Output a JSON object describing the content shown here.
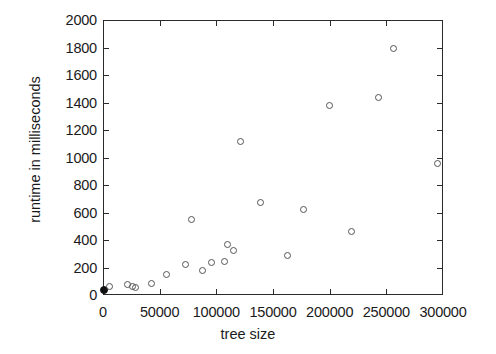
{
  "chart_data": {
    "type": "scatter",
    "title": "",
    "xlabel": "tree size",
    "ylabel": "runtime in milliseconds",
    "xlim": [
      0,
      300000
    ],
    "ylim": [
      0,
      2000
    ],
    "xticks": [
      0,
      50000,
      100000,
      150000,
      200000,
      250000,
      300000
    ],
    "yticks": [
      0,
      200,
      400,
      600,
      800,
      1000,
      1200,
      1400,
      1600,
      1800,
      2000
    ],
    "xtick_labels": [
      "0",
      "50000",
      "100000",
      "150000",
      "200000",
      "250000",
      "300000"
    ],
    "ytick_labels": [
      "0",
      "200",
      "400",
      "600",
      "800",
      "1000",
      "1200",
      "1400",
      "1600",
      "1800",
      "2000"
    ],
    "grid": false,
    "legend": null,
    "marker": "open-circle",
    "points": [
      {
        "x": 500,
        "y": 40,
        "style": "filled"
      },
      {
        "x": 6000,
        "y": 60,
        "style": "open"
      },
      {
        "x": 22000,
        "y": 75,
        "style": "open"
      },
      {
        "x": 26000,
        "y": 65,
        "style": "open"
      },
      {
        "x": 29000,
        "y": 58,
        "style": "open"
      },
      {
        "x": 43000,
        "y": 85,
        "style": "open"
      },
      {
        "x": 56000,
        "y": 150,
        "style": "open"
      },
      {
        "x": 73000,
        "y": 220,
        "style": "open"
      },
      {
        "x": 78000,
        "y": 550,
        "style": "open"
      },
      {
        "x": 88000,
        "y": 175,
        "style": "open"
      },
      {
        "x": 96000,
        "y": 240,
        "style": "open"
      },
      {
        "x": 107000,
        "y": 245,
        "style": "open"
      },
      {
        "x": 110000,
        "y": 365,
        "style": "open"
      },
      {
        "x": 115000,
        "y": 325,
        "style": "open"
      },
      {
        "x": 121000,
        "y": 1120,
        "style": "open"
      },
      {
        "x": 139000,
        "y": 675,
        "style": "open"
      },
      {
        "x": 163000,
        "y": 285,
        "style": "open"
      },
      {
        "x": 177000,
        "y": 625,
        "style": "open"
      },
      {
        "x": 200000,
        "y": 1380,
        "style": "open"
      },
      {
        "x": 219000,
        "y": 460,
        "style": "open"
      },
      {
        "x": 243000,
        "y": 1440,
        "style": "open"
      },
      {
        "x": 256000,
        "y": 1795,
        "style": "open"
      },
      {
        "x": 295000,
        "y": 960,
        "style": "open"
      }
    ],
    "colors": {
      "axis": "#2b2b2b",
      "marker": "#555555",
      "background": "#ffffff",
      "text": "#1a1a1a"
    }
  }
}
